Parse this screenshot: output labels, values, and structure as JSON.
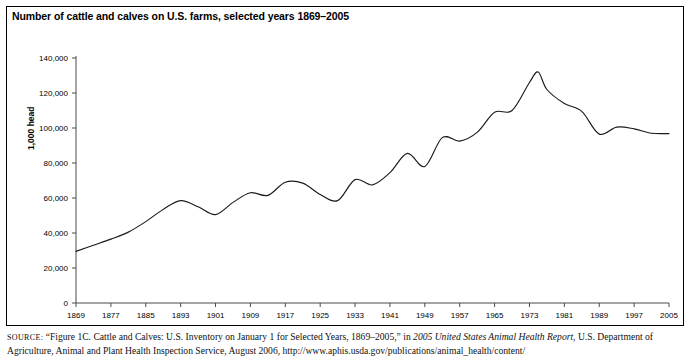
{
  "figure": {
    "title": "Number of cattle and calves on U.S. farms, selected years 1869–2005",
    "y_axis_label": "1,000 head",
    "source_prefix": "SOURCE:",
    "source_part1": " “Figure 1C. Cattle and Calves: U.S. Inventory on January 1 for Selected Years, 1869–2005,” in ",
    "source_italic": "2005 United States Animal Health Report",
    "source_part2": ", U.S. Department of Agriculture, Animal and Plant Health Inspection Service, August 2006, http://www.aphis.usda.gov/publications/animal_health/content/"
  },
  "chart_data": {
    "type": "line",
    "title": "Number of cattle and calves on U.S. farms, selected years 1869–2005",
    "xlabel": "",
    "ylabel": "1,000 head",
    "xlim": [
      1869,
      2005
    ],
    "ylim": [
      0,
      140000
    ],
    "grid": false,
    "legend": "none",
    "line_color": "#1a1a1a",
    "xticks": [
      1869,
      1877,
      1885,
      1893,
      1901,
      1909,
      1917,
      1925,
      1933,
      1941,
      1949,
      1957,
      1965,
      1973,
      1981,
      1989,
      1997,
      2005
    ],
    "xtick_labels": [
      "1869",
      "1877",
      "1885",
      "1893",
      "1901",
      "1909",
      "1917",
      "1925",
      "1933",
      "1941",
      "1949",
      "1957",
      "1965",
      "1973",
      "1981",
      "1989",
      "1997",
      "2005"
    ],
    "yticks": [
      0,
      20000,
      40000,
      60000,
      80000,
      100000,
      120000,
      140000
    ],
    "ytick_labels": [
      "0",
      "20,000",
      "40,000",
      "60,000",
      "80,000",
      "100,000",
      "120,000",
      "140,000"
    ],
    "series": [
      {
        "name": "Cattle and calves on U.S. farms",
        "x": [
          1869,
          1873,
          1877,
          1881,
          1885,
          1889,
          1893,
          1897,
          1901,
          1905,
          1909,
          1913,
          1917,
          1921,
          1925,
          1929,
          1933,
          1937,
          1941,
          1945,
          1949,
          1953,
          1957,
          1961,
          1965,
          1969,
          1973,
          1975,
          1977,
          1981,
          1985,
          1989,
          1993,
          1997,
          2001,
          2005
        ],
        "y": [
          29500,
          33000,
          36500,
          40500,
          46500,
          53500,
          58500,
          55000,
          50500,
          57500,
          63000,
          61500,
          69000,
          68500,
          62000,
          58500,
          70500,
          67500,
          74500,
          85500,
          78000,
          94500,
          92500,
          97500,
          109000,
          110000,
          126000,
          132000,
          122000,
          114000,
          109500,
          96500,
          100500,
          99500,
          97000,
          96800
        ],
        "smoothed": true
      }
    ],
    "annotations": []
  }
}
